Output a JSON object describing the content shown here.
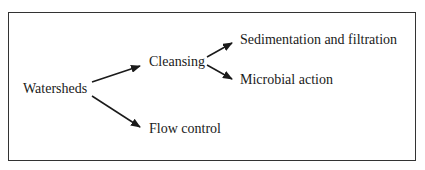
{
  "diagram": {
    "type": "tree",
    "nodes": {
      "root": "Watersheds",
      "cleansing": "Cleansing",
      "flow": "Flow control",
      "sedimentation": "Sedimentation and filtration",
      "microbial": "Microbial action"
    },
    "edges": [
      [
        "Watersheds",
        "Cleansing"
      ],
      [
        "Watersheds",
        "Flow control"
      ],
      [
        "Cleansing",
        "Sedimentation and filtration"
      ],
      [
        "Cleansing",
        "Microbial action"
      ]
    ]
  }
}
